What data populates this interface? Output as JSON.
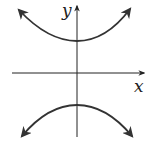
{
  "diagram": {
    "type": "hyperbola",
    "orientation": "vertical",
    "axes": {
      "x_label": "x",
      "y_label": "y"
    },
    "colors": {
      "axis": "#222222",
      "curve": "#333333",
      "background": "#ffffff"
    },
    "branches": [
      {
        "name": "upper",
        "opens": "up",
        "arrows": "both-ends"
      },
      {
        "name": "lower",
        "opens": "down",
        "arrows": "both-ends"
      }
    ]
  }
}
